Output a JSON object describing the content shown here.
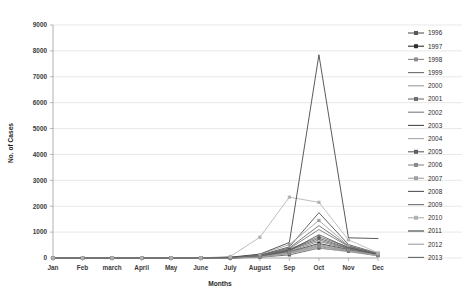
{
  "chart_data": {
    "type": "line",
    "title": "",
    "xlabel": "Months",
    "ylabel": "No. of Cases",
    "categories": [
      "Jan",
      "Feb",
      "march",
      "April",
      "May",
      "June",
      "July",
      "August",
      "Sep",
      "Oct",
      "Nov",
      "Dec"
    ],
    "ylim": [
      0,
      9000
    ],
    "ytick_step": 1000,
    "yticks": [
      "0",
      "1000",
      "2000",
      "3000",
      "4000",
      "5000",
      "6000",
      "7000",
      "8000",
      "9000"
    ],
    "grid": true,
    "legend_position": "right",
    "series": [
      {
        "name": "1996",
        "marker": "square",
        "color": "#575757",
        "values": [
          0,
          0,
          0,
          0,
          0,
          0,
          0,
          30,
          120,
          380,
          260,
          90
        ]
      },
      {
        "name": "1997",
        "marker": "square",
        "color": "#2e2e2e",
        "values": [
          0,
          0,
          0,
          0,
          0,
          0,
          10,
          60,
          240,
          560,
          330,
          120
        ]
      },
      {
        "name": "1998",
        "marker": "square",
        "color": "#8d8d8d",
        "values": [
          0,
          0,
          0,
          0,
          0,
          0,
          0,
          40,
          180,
          430,
          300,
          110
        ]
      },
      {
        "name": "1999",
        "marker": "line",
        "color": "#6b6b6b",
        "values": [
          0,
          0,
          0,
          0,
          0,
          0,
          5,
          70,
          300,
          700,
          360,
          140
        ]
      },
      {
        "name": "2000",
        "marker": "line",
        "color": "#9a9a9a",
        "values": [
          0,
          0,
          0,
          0,
          0,
          0,
          0,
          50,
          210,
          480,
          280,
          100
        ]
      },
      {
        "name": "2001",
        "marker": "square",
        "color": "#6f6f6f",
        "values": [
          0,
          0,
          0,
          0,
          0,
          0,
          15,
          90,
          340,
          820,
          420,
          160
        ]
      },
      {
        "name": "2002",
        "marker": "line",
        "color": "#7d7d7d",
        "values": [
          0,
          0,
          0,
          0,
          0,
          0,
          0,
          45,
          260,
          640,
          350,
          130
        ]
      },
      {
        "name": "2003",
        "marker": "line",
        "color": "#4a4a4a",
        "values": [
          0,
          0,
          0,
          0,
          0,
          0,
          20,
          110,
          430,
          1750,
          520,
          180
        ]
      },
      {
        "name": "2004",
        "marker": "line",
        "color": "#a8a8a8",
        "values": [
          0,
          0,
          0,
          0,
          0,
          0,
          0,
          35,
          170,
          390,
          240,
          85
        ]
      },
      {
        "name": "2005",
        "marker": "square",
        "color": "#5f5f5f",
        "values": [
          0,
          0,
          0,
          0,
          0,
          0,
          10,
          80,
          320,
          760,
          380,
          150
        ]
      },
      {
        "name": "2006",
        "marker": "square",
        "color": "#8a8a8a",
        "values": [
          0,
          0,
          0,
          0,
          0,
          0,
          0,
          55,
          230,
          520,
          310,
          115
        ]
      },
      {
        "name": "2007",
        "marker": "square",
        "color": "#a0a0a0",
        "values": [
          0,
          0,
          0,
          0,
          0,
          0,
          25,
          130,
          520,
          1450,
          480,
          170
        ]
      },
      {
        "name": "2008",
        "marker": "line",
        "color": "#555555",
        "values": [
          0,
          0,
          0,
          0,
          0,
          0,
          0,
          65,
          280,
          900,
          400,
          145
        ]
      },
      {
        "name": "2009",
        "marker": "line",
        "color": "#747474",
        "values": [
          0,
          0,
          0,
          0,
          0,
          0,
          12,
          95,
          360,
          1100,
          450,
          160
        ]
      },
      {
        "name": "2010",
        "marker": "square",
        "color": "#b2b2b2",
        "values": [
          0,
          0,
          0,
          0,
          0,
          0,
          60,
          800,
          2350,
          2150,
          700,
          200
        ]
      },
      {
        "name": "2011",
        "marker": "line",
        "color": "#3d3d3d",
        "values": [
          0,
          0,
          0,
          0,
          0,
          0,
          30,
          150,
          600,
          7850,
          780,
          750
        ]
      },
      {
        "name": "2012",
        "marker": "line",
        "color": "#9e9e9e",
        "values": [
          0,
          0,
          0,
          0,
          0,
          0,
          0,
          40,
          190,
          460,
          270,
          95
        ]
      },
      {
        "name": "2013",
        "marker": "line",
        "color": "#666666",
        "values": [
          0,
          0,
          0,
          0,
          0,
          0,
          18,
          100,
          390,
          1250,
          460,
          165
        ]
      }
    ]
  },
  "axes": {
    "x_title": "Months",
    "y_title": "No. of Cases"
  }
}
